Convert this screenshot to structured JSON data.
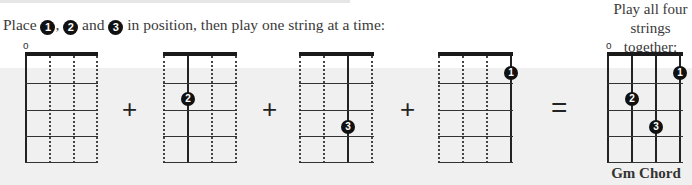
{
  "instruction": {
    "prefix": "Place ",
    "finger1": "1",
    "sep1": ", ",
    "finger2": "2",
    "sep2": " and ",
    "finger3": "3",
    "suffix": " in position, then play one string at a time:"
  },
  "right_caption": {
    "line1": "Play all four",
    "line2": "strings together:"
  },
  "open_string_marker": "o",
  "operators": {
    "plus": "+",
    "equals": "="
  },
  "diagrams": [
    {
      "id": "step-open",
      "open_marker": "o",
      "active_string": 1,
      "dots": []
    },
    {
      "id": "step-finger2",
      "active_string": 2,
      "dots": [
        {
          "label": "2",
          "string": 2,
          "fret": 2
        }
      ]
    },
    {
      "id": "step-finger3",
      "active_string": 3,
      "dots": [
        {
          "label": "3",
          "string": 3,
          "fret": 3
        }
      ]
    },
    {
      "id": "step-finger1",
      "active_string": 4,
      "dots": [
        {
          "label": "1",
          "string": 4,
          "fret": 1
        }
      ]
    },
    {
      "id": "full-chord",
      "open_marker": "o",
      "dots": [
        {
          "label": "1",
          "string": 4,
          "fret": 1
        },
        {
          "label": "2",
          "string": 2,
          "fret": 2
        },
        {
          "label": "3",
          "string": 3,
          "fret": 3
        }
      ]
    }
  ],
  "chord": {
    "name": "Gm Chord"
  },
  "colors": {
    "background_band": "#f0f0f0",
    "ink": "#111111"
  }
}
